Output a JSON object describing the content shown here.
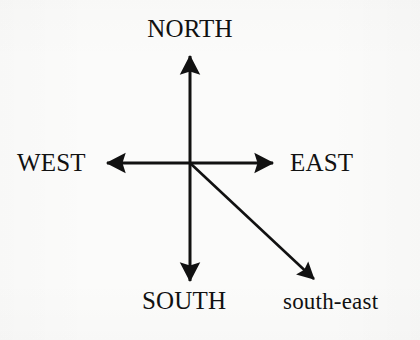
{
  "diagram": {
    "background_color": "#fbfbfa",
    "stroke_color": "#111111",
    "labels": {
      "north": "NORTH",
      "west": "WEST",
      "east": "EAST",
      "south": "SOUTH",
      "south_east": "south-east"
    },
    "arrows": [
      {
        "name": "north-arrow",
        "direction": "north",
        "from": [
          190,
          163
        ],
        "to": [
          190,
          52
        ]
      },
      {
        "name": "south-arrow",
        "direction": "south",
        "from": [
          190,
          163
        ],
        "to": [
          190,
          285
        ]
      },
      {
        "name": "west-arrow",
        "direction": "west",
        "from": [
          190,
          163
        ],
        "to": [
          102,
          163
        ]
      },
      {
        "name": "east-arrow",
        "direction": "east",
        "from": [
          190,
          163
        ],
        "to": [
          278,
          163
        ]
      },
      {
        "name": "south-east-arrow",
        "direction": "south-east",
        "from": [
          190,
          163
        ],
        "to": [
          318,
          283
        ]
      }
    ],
    "origin": [
      190,
      163
    ],
    "line_width": 3,
    "arrowhead_length": 19,
    "arrowhead_width": 17
  }
}
